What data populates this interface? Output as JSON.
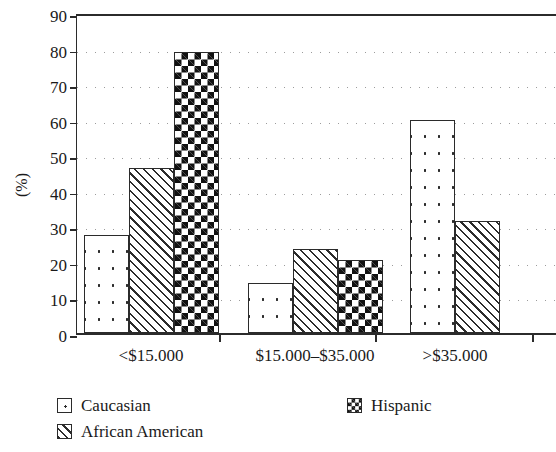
{
  "chart_data": {
    "type": "bar",
    "title": "",
    "xlabel": "",
    "ylabel": "(%)",
    "ylim": [
      0,
      90
    ],
    "yticks": [
      0,
      10,
      20,
      30,
      40,
      50,
      60,
      70,
      80,
      90
    ],
    "grid": true,
    "grid_style": "dotted horizontal",
    "legend_position": "bottom-left",
    "categories": [
      "<$15.000",
      "$15.000–$35.000",
      ">$35.000"
    ],
    "series": [
      {
        "name": "Caucasian",
        "pattern": "dotted",
        "values": [
          27.5,
          14.0,
          60.0
        ]
      },
      {
        "name": "African American",
        "pattern": "diagonal-hatch",
        "values": [
          46.5,
          23.5,
          31.5
        ]
      },
      {
        "name": "Hispanic",
        "pattern": "checkerboard",
        "values": [
          79.0,
          20.5,
          null
        ]
      }
    ]
  },
  "legend": {
    "entries": [
      {
        "label": "Caucasian",
        "swatch": "dotted-swatch-icon"
      },
      {
        "label": "African American",
        "swatch": "hatched-swatch-icon"
      },
      {
        "label": "Hispanic",
        "swatch": "checkered-swatch-icon"
      }
    ]
  }
}
